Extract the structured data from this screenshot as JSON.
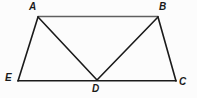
{
  "figure": {
    "name": "trapezoid-with-triangles",
    "background_color": "#fcfcfc",
    "stroke_color": "#1a1a1a",
    "top_edge_color": "#5a5a5a",
    "points": {
      "A": {
        "x": 38,
        "y": 17
      },
      "B": {
        "x": 158,
        "y": 17
      },
      "C": {
        "x": 176,
        "y": 81
      },
      "D": {
        "x": 97,
        "y": 80
      },
      "E": {
        "x": 18,
        "y": 81
      }
    },
    "segments": [
      {
        "name": "segment-AB",
        "from": "A",
        "to": "B"
      },
      {
        "name": "segment-AE",
        "from": "A",
        "to": "E"
      },
      {
        "name": "segment-EC",
        "from": "E",
        "to": "C"
      },
      {
        "name": "segment-BC",
        "from": "B",
        "to": "C"
      },
      {
        "name": "segment-AD",
        "from": "A",
        "to": "D"
      },
      {
        "name": "segment-BD",
        "from": "B",
        "to": "D"
      }
    ],
    "labels": {
      "A": "A",
      "B": "B",
      "C": "C",
      "D": "D",
      "E": "E"
    }
  }
}
